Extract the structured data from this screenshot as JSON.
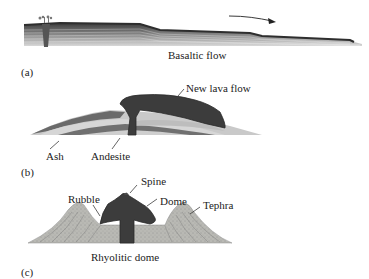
{
  "panels": [
    {
      "id": "a",
      "panel_label": "(a)",
      "caption": "Basaltic  flow",
      "labels": []
    },
    {
      "id": "b",
      "panel_label": "(b)",
      "caption": "",
      "labels": [
        "New lava flow",
        "Ash",
        "Andesite"
      ]
    },
    {
      "id": "c",
      "panel_label": "(c)",
      "caption": "Rhyolitic dome",
      "labels": [
        "Spine",
        "Rubble",
        "Dome",
        "Tephra"
      ]
    }
  ],
  "colors": {
    "dark_lava": "#3a3a3a",
    "mid_layer": "#6e6e6e",
    "light_layer": "#bdbdbd",
    "tephra": "#b5b5b0"
  }
}
